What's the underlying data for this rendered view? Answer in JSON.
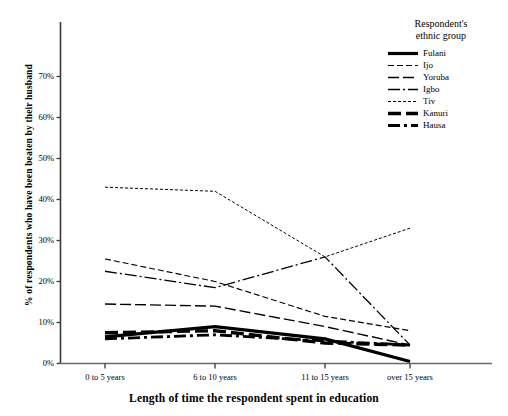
{
  "chart_data": {
    "type": "line",
    "title": "",
    "xlabel": "Length of time the respondent spent in education",
    "ylabel": "% of respondents who have been beaten by their husband",
    "categories": [
      "0 to 5 years",
      "6 to 10 years",
      "11 to 15 years",
      "over 15 years"
    ],
    "ylim": [
      0,
      75
    ],
    "yticks": [
      "0%",
      "10%",
      "20%",
      "30%",
      "40%",
      "50%",
      "60%",
      "70%"
    ],
    "ytick_values": [
      0,
      10,
      20,
      30,
      40,
      50,
      60,
      70
    ],
    "grid": false,
    "legend_position": "top-right",
    "legend_title": "Respondent's ethnic group",
    "series": [
      {
        "name": "Fulani",
        "values": [
          6.5,
          9.0,
          6.0,
          0.5
        ],
        "style": "solid-bold",
        "width": 3.2,
        "dash": ""
      },
      {
        "name": "Ijo",
        "values": [
          25.5,
          20.0,
          11.5,
          8.0
        ],
        "style": "dashed-short",
        "width": 1.1,
        "dash": "6,3"
      },
      {
        "name": "Yoruba",
        "values": [
          14.5,
          14.0,
          9.0,
          4.5
        ],
        "style": "dashed-long",
        "width": 1.4,
        "dash": "11,4"
      },
      {
        "name": "Igbo",
        "values": [
          22.5,
          18.5,
          26.0,
          4.5
        ],
        "style": "dash-dot",
        "width": 1.3,
        "dash": "12,3,2,3"
      },
      {
        "name": "Tiv",
        "values": [
          43.0,
          42.0,
          26.0,
          33.0
        ],
        "style": "dotted-fine",
        "width": 1.0,
        "dash": "3,2"
      },
      {
        "name": "Kanuri",
        "values": [
          7.5,
          8.0,
          5.0,
          4.5
        ],
        "style": "dashed-bold",
        "width": 3.4,
        "dash": "13,5"
      },
      {
        "name": "Hausa",
        "values": [
          6.0,
          7.0,
          5.5,
          4.5
        ],
        "style": "dash-dot-bold",
        "width": 2.8,
        "dash": "12,4,3,4"
      }
    ]
  },
  "axis": {
    "x_axis_name": "x-axis",
    "y_axis_name": "y-axis"
  }
}
